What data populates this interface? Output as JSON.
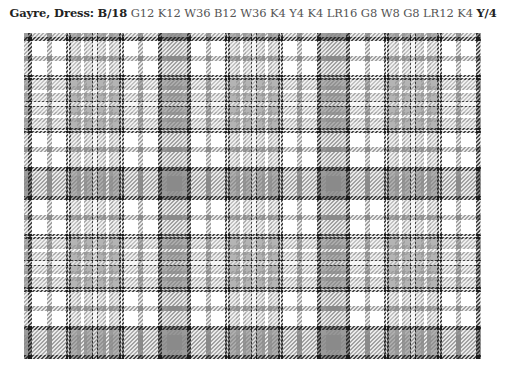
{
  "title": {
    "name_label": "Gayre, Dress:",
    "pivot_start": "B/18",
    "threadcount_middle": "G12 K12 W36 B12 W36 K4 Y4 K4 LR16 G8 W8 G8 LR12 K4",
    "pivot_end": "Y/4"
  },
  "tartan": {
    "sett": [
      {
        "color": "B",
        "count": 18,
        "pivot": true
      },
      {
        "color": "G",
        "count": 12
      },
      {
        "color": "K",
        "count": 12
      },
      {
        "color": "W",
        "count": 36
      },
      {
        "color": "B",
        "count": 12
      },
      {
        "color": "W",
        "count": 36
      },
      {
        "color": "K",
        "count": 4
      },
      {
        "color": "Y",
        "count": 4
      },
      {
        "color": "K",
        "count": 4
      },
      {
        "color": "LR",
        "count": 16
      },
      {
        "color": "G",
        "count": 8
      },
      {
        "color": "W",
        "count": 8
      },
      {
        "color": "G",
        "count": 8
      },
      {
        "color": "LR",
        "count": 12
      },
      {
        "color": "K",
        "count": 4
      },
      {
        "color": "Y",
        "count": 4,
        "pivot": true
      }
    ],
    "gray_levels": {
      "B": "#8a8a8a",
      "G": "#9a9a9a",
      "K": "#1a1a1a",
      "W": "#ffffff",
      "Y": "#ececec",
      "LR": "#b4b4b4"
    },
    "repeat_px": 159,
    "offset_x_px": -9,
    "offset_y_px": -9
  }
}
